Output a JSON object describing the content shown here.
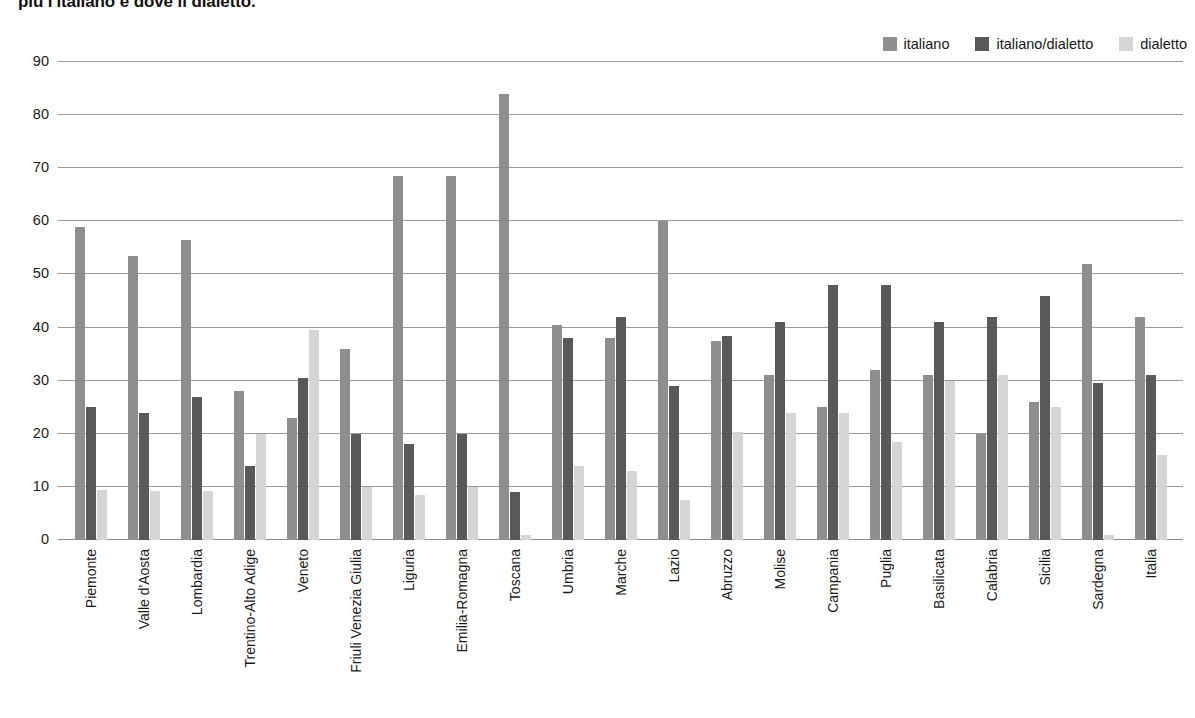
{
  "title": "più l'italiano e dove il dialetto.",
  "legend": {
    "position": "top-right",
    "entries": [
      {
        "label": "italiano",
        "color": "#8e8e8e",
        "swatch_name": "legend-swatch-italiano"
      },
      {
        "label": "italiano/dialetto",
        "color": "#595959",
        "swatch_name": "legend-swatch-italiano-dialetto"
      },
      {
        "label": "dialetto",
        "color": "#d5d5d5",
        "swatch_name": "legend-swatch-dialetto"
      }
    ]
  },
  "chart_data": {
    "type": "bar",
    "title": "più l'italiano e dove il dialetto.",
    "xlabel": "",
    "ylabel": "",
    "ylim": [
      0,
      90
    ],
    "yticks": [
      0,
      10,
      20,
      30,
      40,
      50,
      60,
      70,
      80,
      90
    ],
    "grid": true,
    "legend_position": "top-right",
    "categories": [
      "Piemonte",
      "Valle d'Aosta",
      "Lombardia",
      "Trentino-Alto Adige",
      "Veneto",
      "Friuli Venezia Giulia",
      "Liguria",
      "Emilia-Romagna",
      "Toscana",
      "Umbria",
      "Marche",
      "Lazio",
      "Abruzzo",
      "Molise",
      "Campania",
      "Puglia",
      "Basilicata",
      "Calabria",
      "Sicilia",
      "Sardegna",
      "Italia"
    ],
    "series": [
      {
        "name": "italiano",
        "color": "#8e8e8e",
        "values": [
          59,
          53.5,
          56.5,
          28,
          23,
          36,
          68.5,
          68.5,
          84,
          40.5,
          38,
          60,
          37.5,
          31,
          25,
          32,
          31,
          20,
          26,
          52,
          42
        ]
      },
      {
        "name": "italiano/dialetto",
        "color": "#595959",
        "values": [
          25,
          24,
          27,
          14,
          30.5,
          20,
          18,
          20,
          9,
          38,
          42,
          29,
          38.5,
          41,
          48,
          48,
          41,
          42,
          46,
          29.5,
          31
        ]
      },
      {
        "name": "dialetto",
        "color": "#d5d5d5",
        "values": [
          9.5,
          9.2,
          9.2,
          20,
          39.5,
          10,
          8.5,
          10,
          1,
          14,
          13,
          7.5,
          20.3,
          24,
          24,
          18.5,
          30,
          31,
          25,
          1,
          16
        ]
      }
    ]
  }
}
